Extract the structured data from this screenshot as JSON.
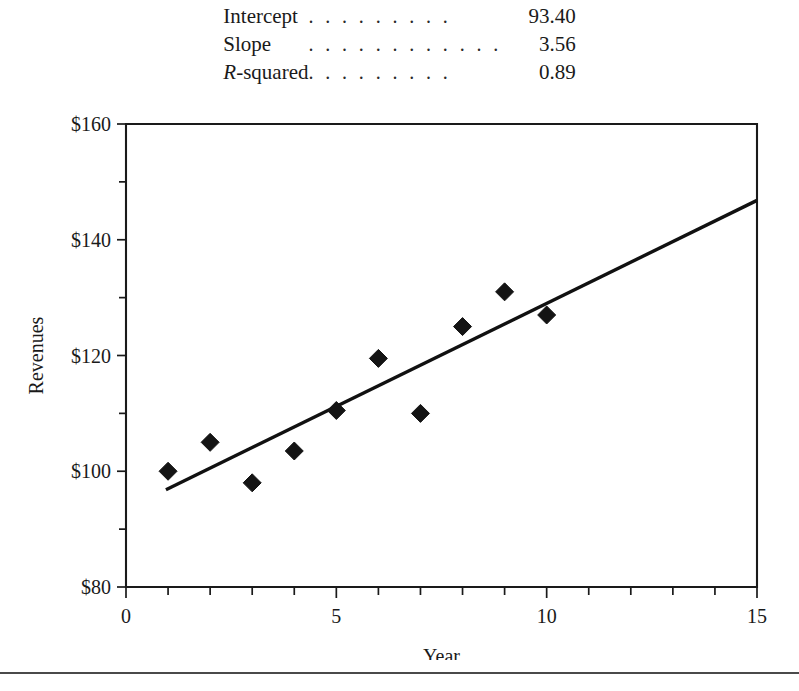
{
  "stats": {
    "rows": [
      {
        "label": "Intercept",
        "label_italic_prefix": "",
        "leader": ". . . . . . . . .",
        "value": "93.40"
      },
      {
        "label": "Slope",
        "label_italic_prefix": "",
        "leader": ". . . . . . . . . . . .",
        "value": "3.56"
      },
      {
        "label": "-squared",
        "label_italic_prefix": "R",
        "leader": ". . . . . . . . .",
        "value": "0.89"
      }
    ]
  },
  "chart_data": {
    "type": "scatter",
    "title": "",
    "xlabel": "Year",
    "ylabel": "Revenues",
    "xlim": [
      0,
      15
    ],
    "ylim": [
      80,
      160
    ],
    "grid": false,
    "legend": null,
    "x_ticks_major": [
      0,
      5,
      10,
      15
    ],
    "x_tick_labels": [
      "0",
      "5",
      "10",
      "15"
    ],
    "x_ticks_minor": [
      1,
      2,
      3,
      4,
      6,
      7,
      8,
      9,
      11,
      12,
      13,
      14
    ],
    "y_ticks_major": [
      80,
      100,
      120,
      140,
      160
    ],
    "y_tick_labels": [
      "$80",
      "$100",
      "$120",
      "$140",
      "$160"
    ],
    "y_ticks_minor": [
      90,
      110,
      130,
      150
    ],
    "marker_style": "diamond",
    "x": [
      1,
      2,
      3,
      4,
      5,
      6,
      7,
      8,
      9,
      10
    ],
    "y": [
      100,
      105,
      98,
      103.5,
      110.5,
      119.5,
      110,
      125,
      131,
      127
    ],
    "series": [
      {
        "name": "Revenues",
        "x": [
          1,
          2,
          3,
          4,
          5,
          6,
          7,
          8,
          9,
          10
        ],
        "values": [
          100,
          105,
          98,
          103.5,
          110.5,
          119.5,
          110,
          125,
          131,
          127
        ]
      }
    ],
    "trendline": {
      "type": "linear-regression",
      "intercept": 93.4,
      "slope": 3.56,
      "r_squared": 0.89,
      "x_start": 0.95,
      "x_end": 15.0,
      "y_start": 96.8,
      "y_end": 146.8
    }
  }
}
